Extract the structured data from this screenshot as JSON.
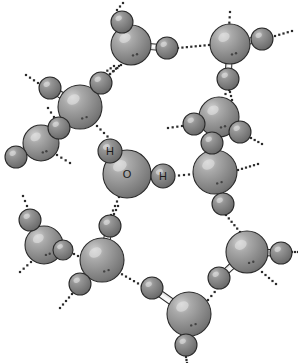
{
  "figure": {
    "background_color": "#ffffff",
    "width": 298,
    "height": 363
  },
  "legend": {
    "oxygen_label": "O",
    "hydrogen_label": "H"
  },
  "style": {
    "oxygen_color": "#8a8a8a",
    "oxygen_highlight": "#c8c8c8",
    "oxygen_shadow": "#5a5a5a",
    "hydrogen_color": "#7a7a7a",
    "hydrogen_highlight": "#b4b4b4",
    "hydrogen_shadow": "#4a4a4a",
    "outline_color": "#2b2b2b",
    "bond_fill": "#f2f2f2",
    "bond_outline": "#2b2b2b",
    "hbond_dot_color": "#2b2b2b",
    "label_color": "#1a1a1a"
  },
  "molecules": [
    {
      "id": "central",
      "labeled": true,
      "oxygen": {
        "cx": 127,
        "cy": 174,
        "r": 24,
        "label": "O"
      },
      "hydrogens": [
        {
          "cx": 110,
          "cy": 151,
          "r": 12,
          "label": "H"
        },
        {
          "cx": 163,
          "cy": 176,
          "r": 12,
          "label": "H"
        }
      ]
    },
    {
      "id": "top-center",
      "labeled": false,
      "oxygen": {
        "cx": 131,
        "cy": 45,
        "r": 20,
        "label": ""
      },
      "hydrogens": [
        {
          "cx": 122,
          "cy": 22,
          "r": 11,
          "label": ""
        },
        {
          "cx": 167,
          "cy": 48,
          "r": 11,
          "label": ""
        }
      ]
    },
    {
      "id": "top-right",
      "labeled": false,
      "oxygen": {
        "cx": 230,
        "cy": 44,
        "r": 20,
        "label": ""
      },
      "hydrogens": [
        {
          "cx": 262,
          "cy": 39,
          "r": 11,
          "label": ""
        },
        {
          "cx": 228,
          "cy": 79,
          "r": 11,
          "label": ""
        }
      ]
    },
    {
      "id": "upper-left",
      "labeled": false,
      "oxygen": {
        "cx": 80,
        "cy": 107,
        "r": 22,
        "label": ""
      },
      "hydrogens": [
        {
          "cx": 50,
          "cy": 88,
          "r": 11,
          "label": ""
        },
        {
          "cx": 101,
          "cy": 83,
          "r": 11,
          "label": ""
        }
      ]
    },
    {
      "id": "left-mid",
      "labeled": false,
      "oxygen": {
        "cx": 41,
        "cy": 143,
        "r": 18,
        "label": ""
      },
      "hydrogens": [
        {
          "cx": 59,
          "cy": 128,
          "r": 11,
          "label": ""
        },
        {
          "cx": 16,
          "cy": 157,
          "r": 11,
          "label": ""
        }
      ]
    },
    {
      "id": "right-upper",
      "labeled": false,
      "oxygen": {
        "cx": 219,
        "cy": 117,
        "r": 20,
        "label": ""
      },
      "hydrogens": [
        {
          "cx": 194,
          "cy": 124,
          "r": 11,
          "label": ""
        },
        {
          "cx": 240,
          "cy": 132,
          "r": 11,
          "label": ""
        }
      ]
    },
    {
      "id": "right-lower",
      "labeled": false,
      "oxygen": {
        "cx": 215,
        "cy": 172,
        "r": 22,
        "label": ""
      },
      "hydrogens": [
        {
          "cx": 212,
          "cy": 143,
          "r": 11,
          "label": ""
        },
        {
          "cx": 223,
          "cy": 204,
          "r": 11,
          "label": ""
        }
      ]
    },
    {
      "id": "lower-left-small",
      "labeled": false,
      "oxygen": {
        "cx": 44,
        "cy": 245,
        "r": 19,
        "label": ""
      },
      "hydrogens": [
        {
          "cx": 30,
          "cy": 220,
          "r": 11,
          "label": ""
        },
        {
          "cx": 63,
          "cy": 250,
          "r": 10,
          "label": ""
        }
      ]
    },
    {
      "id": "lower-left-big",
      "labeled": false,
      "oxygen": {
        "cx": 102,
        "cy": 260,
        "r": 22,
        "label": ""
      },
      "hydrogens": [
        {
          "cx": 110,
          "cy": 226,
          "r": 11,
          "label": ""
        },
        {
          "cx": 80,
          "cy": 284,
          "r": 11,
          "label": ""
        }
      ]
    },
    {
      "id": "bottom-center",
      "labeled": false,
      "oxygen": {
        "cx": 189,
        "cy": 314,
        "r": 22,
        "label": ""
      },
      "hydrogens": [
        {
          "cx": 152,
          "cy": 288,
          "r": 11,
          "label": ""
        },
        {
          "cx": 186,
          "cy": 345,
          "r": 11,
          "label": ""
        }
      ]
    },
    {
      "id": "bottom-right",
      "labeled": false,
      "oxygen": {
        "cx": 247,
        "cy": 252,
        "r": 21,
        "label": ""
      },
      "hydrogens": [
        {
          "cx": 281,
          "cy": 253,
          "r": 11,
          "label": ""
        },
        {
          "cx": 219,
          "cy": 278,
          "r": 11,
          "label": ""
        }
      ]
    }
  ],
  "hydrogen_bonds": [
    {
      "id": "hb-central-h2-right",
      "x1": 174,
      "y1": 176,
      "x2": 194,
      "y2": 174
    },
    {
      "id": "hb-upperleft-o-central",
      "x1": 97,
      "y1": 126,
      "x2": 111,
      "y2": 140
    },
    {
      "id": "hb-central-o-lowerleft",
      "x1": 119,
      "y1": 197,
      "x2": 111,
      "y2": 215
    },
    {
      "id": "hb-topcenter-h-topright",
      "x1": 178,
      "y1": 48,
      "x2": 209,
      "y2": 45
    },
    {
      "id": "hb-upperleft-h-topcenter",
      "x1": 110,
      "y1": 74,
      "x2": 121,
      "y2": 65
    },
    {
      "id": "hb-topright-h-rightupper",
      "x1": 229,
      "y1": 90,
      "x2": 222,
      "y2": 98
    },
    {
      "id": "hb-rightupper-rightlower",
      "x1": 219,
      "y1": 137,
      "x2": 216,
      "y2": 150
    },
    {
      "id": "hb-rightlower-h-bottomright",
      "x1": 226,
      "y1": 215,
      "x2": 240,
      "y2": 232
    },
    {
      "id": "hb-lowerleftsmall-lowerleftbig",
      "x1": 74,
      "y1": 254,
      "x2": 82,
      "y2": 258
    },
    {
      "id": "hb-lowerleftbig-bottomcenter",
      "x1": 118,
      "y1": 272,
      "x2": 146,
      "y2": 288
    },
    {
      "id": "hb-bottomcenter-bottomright",
      "x1": 208,
      "y1": 300,
      "x2": 218,
      "y2": 288
    },
    {
      "id": "hb-stub-topcenter-up",
      "x1": 117,
      "y1": 10,
      "x2": 123,
      "y2": 3
    },
    {
      "id": "hb-stub-topcenter-down",
      "x1": 114,
      "y1": 66,
      "x2": 104,
      "y2": 73
    },
    {
      "id": "hb-stub-topright-up",
      "x1": 229,
      "y1": 28,
      "x2": 230,
      "y2": 12
    },
    {
      "id": "hb-stub-topright-right",
      "x1": 275,
      "y1": 36,
      "x2": 292,
      "y2": 31
    },
    {
      "id": "hb-stub-topright-hdown",
      "x1": 230,
      "y1": 92,
      "x2": 232,
      "y2": 100
    },
    {
      "id": "hb-stub-upperleft-hleft",
      "x1": 38,
      "y1": 83,
      "x2": 26,
      "y2": 75
    },
    {
      "id": "hb-stub-upperleft-hright",
      "x1": 110,
      "y1": 74,
      "x2": 119,
      "y2": 66
    },
    {
      "id": "hb-stub-leftmid-up",
      "x1": 54,
      "y1": 117,
      "x2": 48,
      "y2": 108
    },
    {
      "id": "hb-stub-leftmid-right",
      "x1": 57,
      "y1": 155,
      "x2": 70,
      "y2": 163
    },
    {
      "id": "hb-stub-rightupper-left",
      "x1": 182,
      "y1": 126,
      "x2": 168,
      "y2": 128
    },
    {
      "id": "hb-stub-rightupper-right",
      "x1": 251,
      "y1": 138,
      "x2": 262,
      "y2": 144
    },
    {
      "id": "hb-stub-rightlower-right",
      "x1": 238,
      "y1": 170,
      "x2": 258,
      "y2": 164
    },
    {
      "id": "hb-stub-lowerleftsmall-up",
      "x1": 27,
      "y1": 206,
      "x2": 23,
      "y2": 196
    },
    {
      "id": "hb-stub-lowerleftsmall-dl",
      "x1": 31,
      "y1": 262,
      "x2": 20,
      "y2": 272
    },
    {
      "id": "hb-stub-lowerleftbig-up",
      "x1": 114,
      "y1": 214,
      "x2": 118,
      "y2": 206
    },
    {
      "id": "hb-stub-lowerleftbig-dl",
      "x1": 72,
      "y1": 294,
      "x2": 60,
      "y2": 308
    },
    {
      "id": "hb-stub-bottomcenter-down",
      "x1": 186,
      "y1": 357,
      "x2": 187,
      "y2": 363
    },
    {
      "id": "hb-stub-bottomright-right",
      "x1": 292,
      "y1": 252,
      "x2": 298,
      "y2": 252
    },
    {
      "id": "hb-stub-bottomright-dr",
      "x1": 262,
      "y1": 272,
      "x2": 276,
      "y2": 284
    }
  ]
}
